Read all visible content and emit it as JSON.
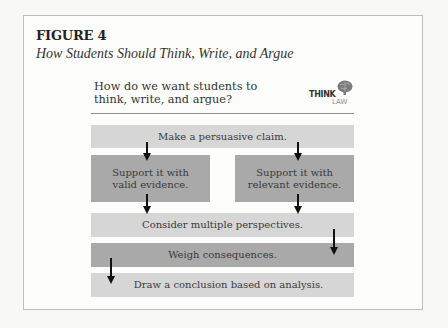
{
  "figure": {
    "label": "FIGURE 4",
    "caption": "How Students Should Think, Write, and Argue"
  },
  "diagram": {
    "question": "How do we want students to think, write, and argue?",
    "logo": {
      "top": "THINK",
      "bottom": "LAW",
      "icon": "brain-icon"
    },
    "steps": {
      "claim": "Make a persuasive claim.",
      "valid": "Support it with valid evidence.",
      "relevant": "Support it with relevant evidence.",
      "consider": "Consider multiple perspectives.",
      "weigh": "Weigh consequences.",
      "draw": "Draw a conclusion based on analysis."
    },
    "colors": {
      "light_box": "#d6d6d6",
      "dark_box": "#a9a9a9",
      "arrow": "#111111"
    }
  }
}
